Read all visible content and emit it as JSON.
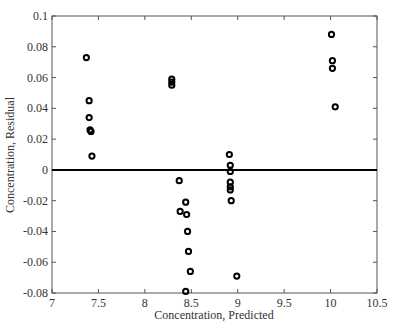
{
  "chart_data": {
    "type": "scatter",
    "title": "",
    "xlabel": "Concentration, Predicted",
    "ylabel": "Concentration, Residual",
    "xlim": [
      7,
      10.5
    ],
    "ylim": [
      -0.08,
      0.1
    ],
    "xticks": [
      7,
      7.5,
      8,
      8.5,
      9,
      9.5,
      10,
      10.5
    ],
    "xtick_labels": [
      "7",
      "7.5",
      "8",
      "8.5",
      "9",
      "9.5",
      "10",
      "10.5"
    ],
    "yticks": [
      -0.08,
      -0.06,
      -0.04,
      -0.02,
      0,
      0.02,
      0.04,
      0.06,
      0.08,
      0.1
    ],
    "ytick_labels": [
      "-0.08",
      "-0.06",
      "-0.04",
      "-0.02",
      "0",
      "0.02",
      "0.04",
      "0.06",
      "0.08",
      "0.1"
    ],
    "grid": false,
    "legend": null,
    "reference_line": {
      "y": 0,
      "color": "#000000"
    },
    "marker": "open-circle",
    "series": [
      {
        "name": "residuals",
        "color": "#000000",
        "x": [
          7.37,
          7.4,
          7.4,
          7.41,
          7.42,
          7.43,
          8.29,
          8.29,
          8.29,
          8.37,
          8.38,
          8.44,
          8.45,
          8.46,
          8.47,
          8.49,
          8.44,
          8.91,
          8.92,
          8.92,
          8.92,
          8.92,
          8.92,
          8.93,
          8.99,
          10.01,
          10.02,
          10.02,
          10.05
        ],
        "y": [
          0.073,
          0.045,
          0.034,
          0.026,
          0.025,
          0.009,
          0.059,
          0.057,
          0.055,
          -0.007,
          -0.027,
          -0.021,
          -0.029,
          -0.04,
          -0.053,
          -0.066,
          -0.079,
          0.01,
          0.003,
          -0.001,
          -0.008,
          -0.011,
          -0.013,
          -0.02,
          -0.069,
          0.088,
          0.071,
          0.066,
          0.041
        ]
      }
    ]
  }
}
